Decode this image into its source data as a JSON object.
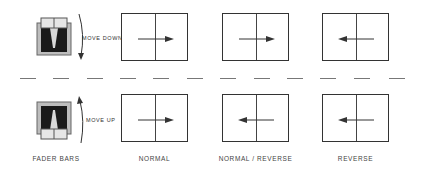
{
  "top_row": {
    "fader_label": "MOVE DOWN",
    "panels": [
      {
        "id": "normal",
        "arrow": "right"
      },
      {
        "id": "normal-reverse",
        "arrow": "right"
      },
      {
        "id": "reverse",
        "arrow": "left"
      }
    ]
  },
  "bottom_row": {
    "fader_label": "MOVE UP",
    "panels": [
      {
        "id": "normal",
        "arrow": "right"
      },
      {
        "id": "normal-reverse",
        "arrow": "left"
      },
      {
        "id": "reverse",
        "arrow": "left"
      }
    ]
  },
  "column_labels": {
    "fader": "FADER BARS",
    "normal": "NORMAL",
    "normal_reverse": "NORMAL / REVERSE",
    "reverse": "REVERSE"
  },
  "colors": {
    "line": "#333333",
    "fader_body": "#bdbdbd",
    "fader_slot": "#1a1a1a",
    "dash": "#777777"
  }
}
